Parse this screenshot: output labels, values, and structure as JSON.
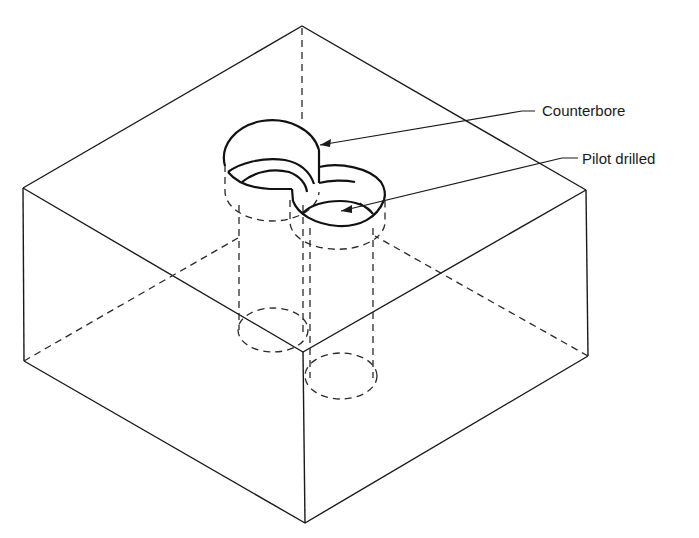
{
  "figure": {
    "colors": {
      "line": "#1a1a1a",
      "background": "#ffffff"
    }
  },
  "labels": {
    "counterbore": "Counterbore",
    "pilot_drilled": "Pilot drilled"
  }
}
